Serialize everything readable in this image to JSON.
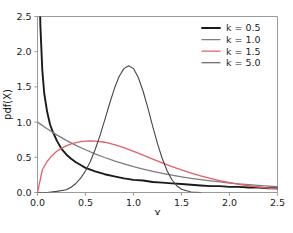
{
  "chart_data": {
    "type": "line",
    "title": "",
    "xlabel": "X",
    "ylabel": "pdf(X)",
    "xlim": [
      0.0,
      2.5
    ],
    "ylim": [
      0.0,
      2.5
    ],
    "xticks": [
      "0.0",
      "0.5",
      "1.0",
      "1.5",
      "2.0",
      "2.5"
    ],
    "xtick_values": [
      0.0,
      0.5,
      1.0,
      1.5,
      2.0,
      2.5
    ],
    "yticks": [
      "0.0",
      "0.5",
      "1.0",
      "1.5",
      "2.0",
      "2.5"
    ],
    "ytick_values": [
      0.0,
      0.5,
      1.0,
      1.5,
      2.0,
      2.5
    ],
    "grid": false,
    "legend_position": "upper right",
    "series": [
      {
        "name": "k = 0.5",
        "color": "#1a1a1a",
        "linewidth": 1.9,
        "x": [
          0.01,
          0.02,
          0.03,
          0.05,
          0.07,
          0.1,
          0.13,
          0.16,
          0.2,
          0.25,
          0.3,
          0.35,
          0.4,
          0.45,
          0.5,
          0.6,
          0.7,
          0.8,
          0.9,
          1.0,
          1.1,
          1.2,
          1.3,
          1.4,
          1.5,
          1.6,
          1.7,
          1.8,
          1.9,
          2.0,
          2.1,
          2.2,
          2.3,
          2.4,
          2.5
        ],
        "y": [
          4.52,
          3.05,
          2.37,
          1.74,
          1.41,
          1.15,
          0.97,
          0.86,
          0.74,
          0.62,
          0.54,
          0.48,
          0.43,
          0.39,
          0.35,
          0.3,
          0.26,
          0.23,
          0.2,
          0.18,
          0.17,
          0.15,
          0.14,
          0.13,
          0.12,
          0.11,
          0.1,
          0.09,
          0.09,
          0.08,
          0.08,
          0.07,
          0.07,
          0.06,
          0.06
        ]
      },
      {
        "name": "k = 1.0",
        "color": "#7d7d7d",
        "linewidth": 1.3,
        "x": [
          0.0,
          0.1,
          0.2,
          0.3,
          0.4,
          0.5,
          0.6,
          0.7,
          0.8,
          0.9,
          1.0,
          1.1,
          1.2,
          1.3,
          1.4,
          1.5,
          1.6,
          1.7,
          1.8,
          1.9,
          2.0,
          2.1,
          2.2,
          2.3,
          2.4,
          2.5
        ],
        "y": [
          1.0,
          0.905,
          0.819,
          0.741,
          0.67,
          0.607,
          0.549,
          0.497,
          0.449,
          0.407,
          0.368,
          0.333,
          0.301,
          0.273,
          0.247,
          0.223,
          0.202,
          0.183,
          0.165,
          0.15,
          0.135,
          0.122,
          0.111,
          0.1,
          0.091,
          0.082
        ]
      },
      {
        "name": "k = 1.5",
        "color": "#e0606a",
        "linewidth": 1.3,
        "x": [
          0.0,
          0.05,
          0.1,
          0.15,
          0.2,
          0.25,
          0.3,
          0.35,
          0.4,
          0.45,
          0.5,
          0.55,
          0.6,
          0.7,
          0.8,
          0.9,
          1.0,
          1.1,
          1.2,
          1.3,
          1.4,
          1.5,
          1.6,
          1.7,
          1.8,
          1.9,
          2.0,
          2.1,
          2.2,
          2.3,
          2.4,
          2.5
        ],
        "y": [
          0.0,
          0.323,
          0.44,
          0.523,
          0.585,
          0.63,
          0.663,
          0.69,
          0.71,
          0.722,
          0.73,
          0.732,
          0.73,
          0.714,
          0.681,
          0.637,
          0.585,
          0.53,
          0.474,
          0.42,
          0.368,
          0.32,
          0.276,
          0.236,
          0.2,
          0.168,
          0.14,
          0.116,
          0.096,
          0.078,
          0.063,
          0.051
        ]
      },
      {
        "name": "k = 5.0",
        "color": "#4d4246",
        "linewidth": 1.1,
        "x": [
          0.0,
          0.1,
          0.2,
          0.3,
          0.35,
          0.4,
          0.45,
          0.5,
          0.55,
          0.6,
          0.65,
          0.7,
          0.75,
          0.8,
          0.85,
          0.9,
          0.95,
          1.0,
          1.05,
          1.1,
          1.15,
          1.2,
          1.25,
          1.3,
          1.35,
          1.4,
          1.45,
          1.5,
          1.6,
          1.7
        ],
        "y": [
          0.0,
          0.0005,
          0.016,
          0.04,
          0.075,
          0.128,
          0.204,
          0.306,
          0.44,
          0.607,
          0.805,
          1.027,
          1.257,
          1.473,
          1.648,
          1.76,
          1.8,
          1.76,
          1.634,
          1.438,
          1.198,
          0.94,
          0.694,
          0.48,
          0.308,
          0.181,
          0.096,
          0.046,
          0.007,
          0.0005
        ]
      }
    ]
  },
  "legend": {
    "entries": [
      {
        "label": "k = 0.5",
        "color": "#1a1a1a"
      },
      {
        "label": "k = 1.0",
        "color": "#7d7d7d"
      },
      {
        "label": "k = 1.5",
        "color": "#e0606a"
      },
      {
        "label": "k = 5.0",
        "color": "#4d4246"
      }
    ]
  },
  "caption": {
    "text": ""
  }
}
